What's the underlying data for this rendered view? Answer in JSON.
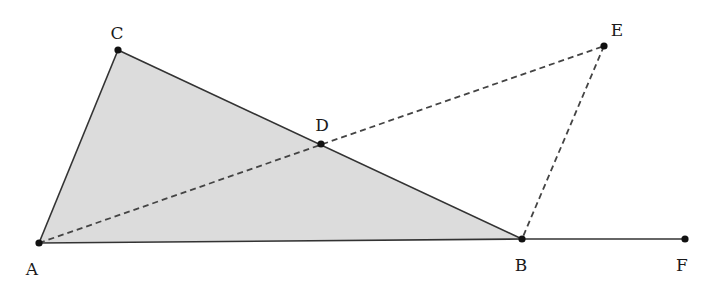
{
  "diagram": {
    "type": "geometry",
    "colors": {
      "fill": "#dcdcdc",
      "stroke": "#333333",
      "dashed": "#444444",
      "point": "#111111",
      "background": "#ffffff"
    },
    "points": [
      {
        "id": "A",
        "label": "A",
        "x": 39,
        "y": 243,
        "lx": 32,
        "ly": 275
      },
      {
        "id": "B",
        "label": "B",
        "x": 522,
        "y": 239,
        "lx": 521,
        "ly": 271
      },
      {
        "id": "C",
        "label": "C",
        "x": 118,
        "y": 50,
        "lx": 117,
        "ly": 39
      },
      {
        "id": "D",
        "label": "D",
        "x": 321,
        "y": 144,
        "lx": 322,
        "ly": 131
      },
      {
        "id": "E",
        "label": "E",
        "x": 604,
        "y": 46,
        "lx": 617,
        "ly": 36
      },
      {
        "id": "F",
        "label": "F",
        "x": 685,
        "y": 239,
        "lx": 682,
        "ly": 271
      }
    ],
    "shaded_polygon": [
      "A",
      "C",
      "B"
    ],
    "solid_segments": [
      [
        "A",
        "C"
      ],
      [
        "C",
        "B"
      ],
      [
        "A",
        "B"
      ],
      [
        "B",
        "F"
      ]
    ],
    "dashed_segments": [
      [
        "A",
        "E"
      ],
      [
        "E",
        "B"
      ]
    ]
  }
}
